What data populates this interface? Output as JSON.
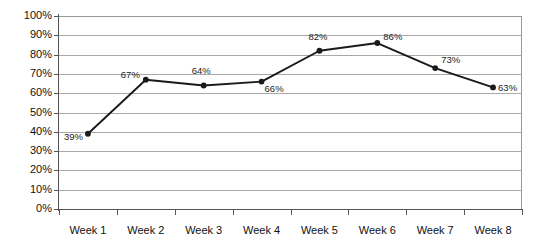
{
  "chart_data": {
    "type": "line",
    "title": "",
    "subtitle": "",
    "xlabel": "",
    "ylabel": "",
    "categories": [
      "Week 1",
      "Week 2",
      "Week 3",
      "Week 4",
      "Week 5",
      "Week 6",
      "Week 7",
      "Week 8"
    ],
    "values": [
      39,
      67,
      64,
      66,
      82,
      86,
      73,
      63
    ],
    "data_labels": [
      "39%",
      "67%",
      "64%",
      "66%",
      "82%",
      "86%",
      "73%",
      "63%"
    ],
    "ylim": [
      0,
      100
    ],
    "ytick_labels": [
      "0%",
      "10%",
      "20%",
      "30%",
      "40%",
      "50%",
      "60%",
      "70%",
      "80%",
      "90%",
      "100%"
    ],
    "ytick_values": [
      0,
      10,
      20,
      30,
      40,
      50,
      60,
      70,
      80,
      90,
      100
    ],
    "grid": true,
    "grid_axis": "y",
    "legend": false,
    "legend_position": "none",
    "series_color": "#1a1a1a",
    "marker": "circle",
    "gridline_color": "#a8a8a8",
    "axis_color": "#555555"
  },
  "label_offsets": [
    {
      "dx": -24,
      "dy": 3
    },
    {
      "dx": -25,
      "dy": -5
    },
    {
      "dx": -12,
      "dy": -14
    },
    {
      "dx": 3,
      "dy": 7
    },
    {
      "dx": -11,
      "dy": -14
    },
    {
      "dx": 6,
      "dy": -6
    },
    {
      "dx": 6,
      "dy": -8
    },
    {
      "dx": 5,
      "dy": 1
    }
  ]
}
